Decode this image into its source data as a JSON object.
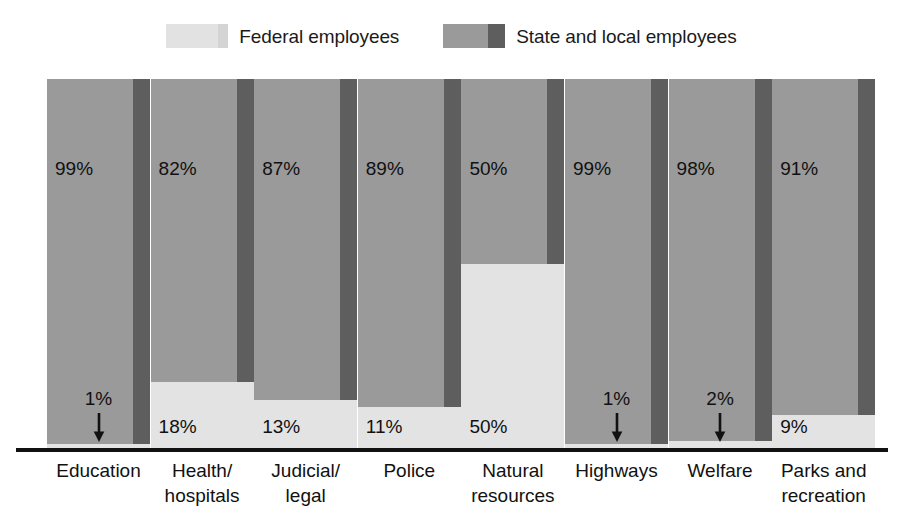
{
  "legend": {
    "entries": [
      {
        "label": "Federal employees",
        "swatch": "federal-swatch",
        "color": "#e3e3e3"
      },
      {
        "label": "State and local employees",
        "swatch": "state-local-swatch",
        "color": "#9a9a9a"
      }
    ]
  },
  "chart_data": {
    "type": "bar",
    "title": "",
    "subtype": "stacked-100-percent",
    "xlabel": "",
    "ylabel": "",
    "ylim": [
      0,
      100
    ],
    "grid": false,
    "legend_position": "top-center",
    "categories": [
      "Education",
      "Health/ hospitals",
      "Judicial/ legal",
      "Police",
      "Natural resources",
      "Highways",
      "Welfare",
      "Parks and recreation"
    ],
    "category_lines": [
      [
        "Education"
      ],
      [
        "Health/",
        "hospitals"
      ],
      [
        "Judicial/",
        "legal"
      ],
      [
        "Police"
      ],
      [
        "Natural",
        "resources"
      ],
      [
        "Highways"
      ],
      [
        "Welfare"
      ],
      [
        "Parks and",
        "recreation"
      ]
    ],
    "series": [
      {
        "name": "State and local employees",
        "color": "#9a9a9a",
        "values": [
          99,
          82,
          87,
          89,
          50,
          99,
          98,
          91
        ],
        "labels": [
          "99%",
          "82%",
          "87%",
          "89%",
          "50%",
          "99%",
          "98%",
          "91%"
        ]
      },
      {
        "name": "Federal employees",
        "color": "#e3e3e3",
        "values": [
          1,
          18,
          13,
          11,
          50,
          1,
          2,
          9
        ],
        "labels": [
          "1%",
          "18%",
          "13%",
          "11%",
          "50%",
          "1%",
          "2%",
          "9%"
        ]
      }
    ],
    "federal_label_has_arrow": [
      true,
      false,
      false,
      false,
      false,
      true,
      true,
      false
    ]
  }
}
